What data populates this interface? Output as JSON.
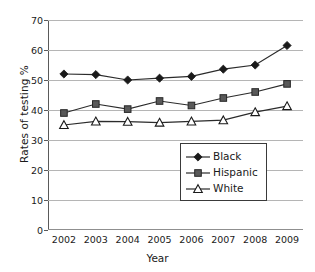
{
  "chart_data": {
    "type": "line",
    "title": "",
    "xlabel": "Year",
    "ylabel": "Rates of testing %",
    "categories": [
      "2002",
      "2003",
      "2004",
      "2005",
      "2006",
      "2007",
      "2008",
      "2009"
    ],
    "x": [
      2002,
      2003,
      2004,
      2005,
      2006,
      2007,
      2008,
      2009
    ],
    "ylim": [
      0,
      70
    ],
    "yticks": [
      0,
      10,
      20,
      30,
      40,
      50,
      60,
      70
    ],
    "ytick_labels": [
      "0",
      "10",
      "20",
      "30",
      "40",
      "50",
      "60",
      "70"
    ],
    "grid": true,
    "legend_position": "lower right",
    "series": [
      {
        "name": "Black",
        "marker": "filled-diamond",
        "color": "#1a1a1a",
        "values": [
          52.0,
          51.8,
          50.0,
          50.6,
          51.2,
          53.6,
          55.0,
          61.5
        ]
      },
      {
        "name": "Hispanic",
        "marker": "filled-square",
        "color": "#4d4d4d",
        "values": [
          39.0,
          42.0,
          40.3,
          43.0,
          41.5,
          44.0,
          46.0,
          48.7
        ]
      },
      {
        "name": "White",
        "marker": "open-triangle",
        "color": "#1a1a1a",
        "values": [
          35.0,
          36.2,
          36.1,
          35.8,
          36.2,
          36.6,
          39.3,
          41.3
        ]
      }
    ]
  },
  "legend": {
    "items": [
      {
        "label": "Black",
        "symbol": "filled-diamond"
      },
      {
        "label": "Hispanic",
        "symbol": "filled-square"
      },
      {
        "label": "White",
        "symbol": "open-triangle"
      }
    ]
  },
  "colors": {
    "gridline": "#b5b5b5",
    "axis": "#5a5a5a",
    "ink": "#1a1a1a",
    "square_fill": "#595959",
    "background": "#ffffff"
  }
}
